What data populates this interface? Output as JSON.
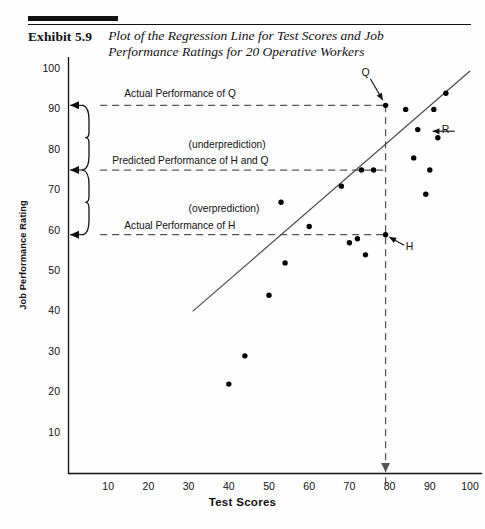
{
  "header": {
    "exhibit_label": "Exhibit 5.9",
    "title": "Plot of the Regression Line for Test Scores and Job Performance Ratings for 20 Operative Workers"
  },
  "colors": {
    "ink": "#111111",
    "rule": "#111111",
    "point": "#000000",
    "line": "#4a4a4a",
    "dash": "#555555"
  },
  "chart_data": {
    "type": "scatter",
    "title": "Plot of the Regression Line for Test Scores and Job Performance Ratings for 20 Operative Workers",
    "xlabel": "Test Scores",
    "ylabel": "Job Performance Rating",
    "xlim": [
      0,
      103
    ],
    "ylim": [
      0,
      103
    ],
    "xticks": [
      10,
      20,
      30,
      40,
      50,
      60,
      70,
      80,
      90,
      100
    ],
    "yticks": [
      10,
      20,
      30,
      40,
      50,
      60,
      70,
      80,
      90,
      100
    ],
    "grid": false,
    "legend": "none",
    "points": [
      {
        "x": 40,
        "y": 22
      },
      {
        "x": 44,
        "y": 29
      },
      {
        "x": 50,
        "y": 44
      },
      {
        "x": 53,
        "y": 67
      },
      {
        "x": 54,
        "y": 52
      },
      {
        "x": 60,
        "y": 61
      },
      {
        "x": 68,
        "y": 71
      },
      {
        "x": 70,
        "y": 57
      },
      {
        "x": 72,
        "y": 58
      },
      {
        "x": 73,
        "y": 75
      },
      {
        "x": 74,
        "y": 54
      },
      {
        "x": 76,
        "y": 75
      },
      {
        "x": 79,
        "y": 91,
        "label": "Q"
      },
      {
        "x": 79,
        "y": 59,
        "label": "H"
      },
      {
        "x": 84,
        "y": 90
      },
      {
        "x": 86,
        "y": 78
      },
      {
        "x": 87,
        "y": 85
      },
      {
        "x": 89,
        "y": 69
      },
      {
        "x": 90,
        "y": 75
      },
      {
        "x": 91,
        "y": 90
      },
      {
        "x": 92,
        "y": 83
      },
      {
        "x": 94,
        "y": 94
      }
    ],
    "regression_line": {
      "x1": 31,
      "y1": 40,
      "x2": 100,
      "y2": 99.5
    },
    "reference_lines": [
      {
        "orientation": "horizontal",
        "value": 91,
        "style": "dashed",
        "from_x": 8,
        "to_x": 79
      },
      {
        "orientation": "horizontal",
        "value": 75,
        "style": "dashed",
        "from_x": 8,
        "to_x": 79
      },
      {
        "orientation": "horizontal",
        "value": 59,
        "style": "dashed",
        "from_x": 8,
        "to_x": 79
      },
      {
        "orientation": "vertical",
        "value": 79,
        "style": "dashed",
        "from_y": 0,
        "to_y": 91
      }
    ],
    "annotations": [
      {
        "text": "Actual Performance of Q",
        "x": 14,
        "y": 93.5
      },
      {
        "text": "(underprediction)",
        "x": 30,
        "y": 81
      },
      {
        "text": "Predicted Performance of H and Q",
        "x": 11,
        "y": 77
      },
      {
        "text": "(overprediction)",
        "x": 30,
        "y": 65
      },
      {
        "text": "Actual Performance of H",
        "x": 14,
        "y": 61
      },
      {
        "text": "Q",
        "x": 73,
        "y": 99
      },
      {
        "text": "R",
        "x": 93,
        "y": 85
      },
      {
        "text": "H",
        "x": 84,
        "y": 56
      }
    ],
    "braces": [
      {
        "from_y": 75,
        "to_y": 91,
        "meaning": "underprediction"
      },
      {
        "from_y": 59,
        "to_y": 75,
        "meaning": "overprediction"
      }
    ]
  }
}
